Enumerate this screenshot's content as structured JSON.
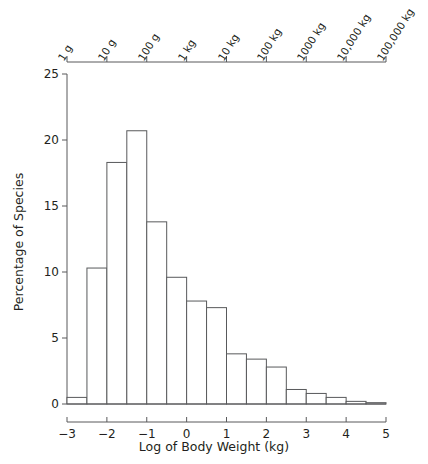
{
  "chart_data": {
    "type": "bar",
    "title": "",
    "subtitle": "",
    "xlabel": "Log of Body Weight (kg)",
    "ylabel": "Percentage of Species",
    "xlim": [
      -3,
      5
    ],
    "ylim": [
      0,
      25
    ],
    "bin_width": 0.5,
    "grid": false,
    "legend": null,
    "xticks": [
      "−3",
      "−2",
      "−1",
      "0",
      "1",
      "2",
      "3",
      "4",
      "5"
    ],
    "xtick_values": [
      -3,
      -2,
      -1,
      0,
      1,
      2,
      3,
      4,
      5
    ],
    "yticks": [
      "0",
      "5",
      "10",
      "15",
      "20",
      "25"
    ],
    "ytick_values": [
      0,
      5,
      10,
      15,
      20,
      25
    ],
    "secondary_axis": {
      "position": "top",
      "label": "",
      "ticks": [
        "1 g",
        "10 g",
        "100 g",
        "1 kg",
        "10 kg",
        "100 kg",
        "1000 kg",
        "10,000 kg",
        "100,000 kg"
      ],
      "tick_values": [
        -3,
        -2,
        -1,
        0,
        1,
        2,
        3,
        4,
        5
      ]
    },
    "bin_edges": [
      -3.0,
      -2.5,
      -2.0,
      -1.5,
      -1.0,
      -0.5,
      0.0,
      0.5,
      1.0,
      1.5,
      2.0,
      2.5,
      3.0,
      3.5,
      4.0,
      4.5,
      5.0
    ],
    "bin_centers": [
      -2.75,
      -2.25,
      -1.75,
      -1.25,
      -0.75,
      -0.25,
      0.25,
      0.75,
      1.25,
      1.75,
      2.25,
      2.75,
      3.25,
      3.75,
      4.25,
      4.75
    ],
    "values": [
      0.5,
      10.3,
      18.3,
      20.7,
      13.8,
      9.6,
      7.8,
      7.3,
      3.8,
      3.4,
      2.8,
      1.1,
      0.8,
      0.5,
      0.2,
      0.1
    ],
    "bar_style": {
      "fill": "#ffffff",
      "stroke": "#58595b",
      "stroke_width": 1
    },
    "axis_color": "#58595b"
  },
  "figure": {
    "xaxis_title": "Log of Body Weight (kg)",
    "yaxis_title": "Percentage of Species"
  }
}
